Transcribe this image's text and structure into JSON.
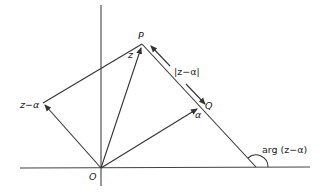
{
  "diagram": {
    "type": "argand-diagram",
    "colors": {
      "line": "#333333",
      "background": "#ffffff"
    },
    "points": {
      "O": {
        "label": "O",
        "x": 101,
        "y": 168
      },
      "P": {
        "label": "P",
        "x": 142,
        "y": 44
      },
      "Q": {
        "label": "Q",
        "x": 201,
        "y": 106
      },
      "Z_minus_alpha": {
        "label": "z−α",
        "x": 43,
        "y": 103
      }
    },
    "labels": {
      "P": "P",
      "Q": "Q",
      "O": "O",
      "z": "z",
      "alpha": "α",
      "z_minus_alpha": "z−α",
      "modulus": "|z−α|",
      "argument": "arg (z−α)"
    }
  }
}
